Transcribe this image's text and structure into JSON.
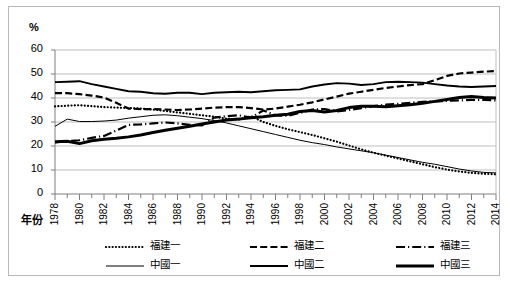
{
  "axis_unit_label": "%",
  "xaxis_title": "年份",
  "legend": {
    "rows": [
      [
        {
          "label": "福建一",
          "style": "dotted",
          "name": "legend-fujian-1"
        },
        {
          "label": "福建二",
          "style": "dashed",
          "name": "legend-fujian-2"
        },
        {
          "label": "福建三",
          "style": "dashdot",
          "name": "legend-fujian-3"
        }
      ],
      [
        {
          "label": "中國一",
          "style": "thin-solid",
          "name": "legend-china-1"
        },
        {
          "label": "中國二",
          "style": "medium-solid",
          "name": "legend-china-2"
        },
        {
          "label": "中國三",
          "style": "thick-solid",
          "name": "legend-china-3"
        }
      ]
    ]
  },
  "chart_data": {
    "type": "line",
    "title": "",
    "xlabel": "年份",
    "ylabel": "%",
    "ylim": [
      0,
      60
    ],
    "yticks": [
      0,
      10,
      20,
      30,
      40,
      50,
      60
    ],
    "xlim": [
      1978,
      2014
    ],
    "xticks": [
      1978,
      1980,
      1982,
      1984,
      1986,
      1988,
      1990,
      1992,
      1994,
      1996,
      1998,
      2000,
      2002,
      2004,
      2006,
      2008,
      2010,
      2012,
      2014
    ],
    "minor_xticks_every": 1,
    "grid": "horizontal",
    "legend_position": "bottom",
    "x": [
      1978,
      1979,
      1980,
      1981,
      1982,
      1983,
      1984,
      1985,
      1986,
      1987,
      1988,
      1989,
      1990,
      1991,
      1992,
      1993,
      1994,
      1995,
      1996,
      1997,
      1998,
      1999,
      2000,
      2001,
      2002,
      2003,
      2004,
      2005,
      2006,
      2007,
      2008,
      2009,
      2010,
      2011,
      2012,
      2013,
      2014
    ],
    "series": [
      {
        "name": "福建一",
        "style": "dotted",
        "color": "#000000",
        "values": [
          36.5,
          36.8,
          37.0,
          36.6,
          36.2,
          36.0,
          35.8,
          35.6,
          35.2,
          34.6,
          34.0,
          33.4,
          32.8,
          32.2,
          31.4,
          31.0,
          32.4,
          30.0,
          28.4,
          27.0,
          25.8,
          24.6,
          23.2,
          21.8,
          20.2,
          18.6,
          17.2,
          16.0,
          14.8,
          13.6,
          12.4,
          11.2,
          10.2,
          9.4,
          8.8,
          8.4,
          8.2
        ]
      },
      {
        "name": "福建二",
        "style": "dashed",
        "color": "#000000",
        "values": [
          42.0,
          42.0,
          41.6,
          41.0,
          40.2,
          38.0,
          35.6,
          35.4,
          35.4,
          35.2,
          35.0,
          35.2,
          35.6,
          36.0,
          36.2,
          36.2,
          35.8,
          35.2,
          35.6,
          36.4,
          37.2,
          38.2,
          39.4,
          40.6,
          41.8,
          42.6,
          43.4,
          44.2,
          44.8,
          45.4,
          45.8,
          47.4,
          49.2,
          50.2,
          50.6,
          51.0,
          51.2
        ]
      },
      {
        "name": "福建三",
        "style": "dashdot",
        "color": "#000000",
        "values": [
          21.5,
          22.0,
          22.4,
          23.4,
          24.2,
          26.4,
          28.8,
          29.0,
          29.4,
          29.8,
          29.4,
          28.8,
          28.6,
          31.8,
          32.4,
          32.8,
          31.8,
          34.8,
          32.8,
          32.6,
          33.8,
          35.2,
          35.4,
          34.4,
          35.0,
          35.8,
          36.6,
          37.2,
          37.6,
          38.0,
          38.4,
          38.6,
          38.8,
          39.0,
          39.2,
          39.2,
          39.0
        ]
      },
      {
        "name": "中國一",
        "style": "thin-solid",
        "color": "#000000",
        "values": [
          28.2,
          31.2,
          30.2,
          30.2,
          30.4,
          30.8,
          31.6,
          32.2,
          32.8,
          33.0,
          32.6,
          32.0,
          31.4,
          30.6,
          29.6,
          28.4,
          27.2,
          26.0,
          24.8,
          23.6,
          22.4,
          21.4,
          20.6,
          19.6,
          18.8,
          18.0,
          17.2,
          16.2,
          15.2,
          14.2,
          13.2,
          12.4,
          11.4,
          10.4,
          9.6,
          9.0,
          8.8
        ]
      },
      {
        "name": "中國二",
        "style": "medium-solid",
        "color": "#000000",
        "values": [
          46.6,
          46.8,
          47.0,
          45.8,
          44.8,
          43.8,
          42.8,
          42.6,
          42.0,
          41.8,
          42.2,
          42.2,
          41.6,
          42.2,
          42.4,
          42.6,
          42.4,
          42.8,
          43.2,
          43.4,
          43.6,
          44.8,
          45.6,
          46.2,
          46.0,
          45.4,
          45.8,
          46.6,
          46.8,
          46.6,
          46.4,
          45.8,
          45.2,
          44.8,
          44.6,
          44.8,
          45.0
        ]
      },
      {
        "name": "中國三",
        "style": "thick-solid",
        "color": "#000000",
        "values": [
          21.8,
          22.0,
          21.0,
          22.2,
          22.8,
          23.2,
          23.8,
          24.6,
          25.6,
          26.6,
          27.4,
          28.2,
          29.2,
          30.0,
          30.8,
          31.2,
          31.8,
          32.2,
          32.8,
          33.2,
          34.4,
          34.8,
          34.2,
          34.8,
          36.0,
          36.6,
          36.6,
          36.4,
          36.8,
          37.2,
          37.8,
          38.6,
          39.4,
          40.2,
          40.6,
          40.2,
          40.0
        ]
      }
    ]
  }
}
